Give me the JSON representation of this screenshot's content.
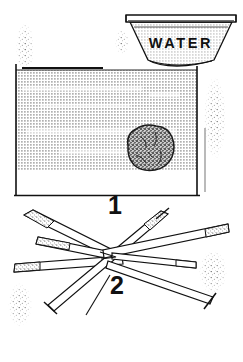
{
  "illustration": {
    "title": "Water poured into tank with rock; scattered sticks",
    "background_color": "#ffffff",
    "ink_color": "#111111",
    "width": 243,
    "height": 362
  },
  "panels": [
    {
      "number": "1",
      "name": "water-tank-panel",
      "caption_number": "1",
      "elements": {
        "bowl": {
          "label_text": "WATER",
          "name": "water-bowl",
          "rim_present": true,
          "fill": "stipple"
        },
        "tank": {
          "name": "tank",
          "fill": "halftone-dots",
          "water_line": true,
          "left_wall": true,
          "right_wall": true,
          "bottom": true
        },
        "rock": {
          "name": "rock",
          "fill": "dark-stipple"
        },
        "speckles": [
          {
            "name": "speckle-top-left"
          },
          {
            "name": "speckle-right"
          }
        ]
      }
    },
    {
      "number": "2",
      "name": "sticks-panel",
      "caption_number": "2",
      "elements": {
        "sticks": [
          {
            "name": "stick-1",
            "end_fill": "stipple"
          },
          {
            "name": "stick-2",
            "end_fill": "stipple"
          },
          {
            "name": "stick-3",
            "end_fill": "stipple"
          },
          {
            "name": "stick-4",
            "end_fill": "stipple"
          },
          {
            "name": "stick-5",
            "end_fill": "stipple"
          },
          {
            "name": "stick-6",
            "end_fill": "stipple"
          },
          {
            "name": "stick-7",
            "end_fill": "stipple"
          }
        ],
        "speckles": [
          {
            "name": "speckle-lower-left"
          },
          {
            "name": "speckle-mid-right"
          }
        ]
      }
    }
  ],
  "labels": {
    "panel_one": "1",
    "panel_two": "2",
    "bowl_text": "WATER"
  },
  "colors": {
    "ink": "#111111",
    "paper": "#ffffff",
    "halftone": "#9a9a9a",
    "rock_dark": "#3a3a3a"
  }
}
